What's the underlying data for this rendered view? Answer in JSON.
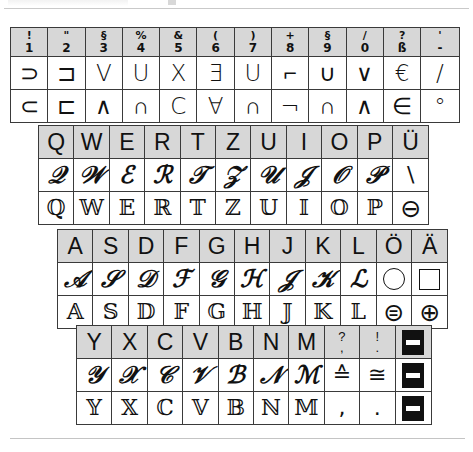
{
  "page": {
    "background_color": "#ffffff",
    "key_fill_color": "#d7d7d7",
    "border_color": "#3a3a3a",
    "rule_color": "#c4c4c4"
  },
  "numeric_block": {
    "name": "number-row",
    "keys": [
      {
        "shift": "!",
        "base": "1"
      },
      {
        "shift": "\"",
        "base": "2"
      },
      {
        "shift": "§",
        "base": "3"
      },
      {
        "shift": "%",
        "base": "4"
      },
      {
        "shift": "&",
        "base": "5"
      },
      {
        "shift": "(",
        "base": "6"
      },
      {
        "shift": ")",
        "base": "7"
      },
      {
        "shift": "+",
        "base": "8"
      },
      {
        "shift": "§",
        "base": "9"
      },
      {
        "shift": "/",
        "base": "0"
      },
      {
        "shift": "?",
        "base": "ß"
      },
      {
        "shift": "'",
        "base": "-"
      }
    ],
    "row_upper": [
      "⊃",
      "⊐",
      "V",
      "U",
      "X",
      "Ǝ",
      "U",
      "⌐",
      "∪",
      "∨",
      "€",
      "/"
    ],
    "row_lower": [
      "⊂",
      "⊏",
      "∧",
      "∩",
      "C",
      "∀",
      "∩",
      "¬",
      "∩",
      "∧",
      "∈",
      "°"
    ]
  },
  "q_block": {
    "name": "qwertz-row",
    "row_plain": [
      "Q",
      "W",
      "E",
      "R",
      "T",
      "Z",
      "U",
      "I",
      "O",
      "P",
      "Ü"
    ],
    "row_script": [
      "𝒬",
      "𝒲",
      "ℰ",
      "ℛ",
      "𝒯",
      "𝒵",
      "𝒰",
      "𝒥",
      "𝒪",
      "𝒫",
      "\\"
    ],
    "row_double": [
      "ℚ",
      "𝕎",
      "𝔼",
      "ℝ",
      "𝕋",
      "ℤ",
      "𝕌",
      "𝕀",
      "𝕆",
      "ℙ",
      "⊖"
    ]
  },
  "a_block": {
    "name": "asdf-row",
    "row_plain": [
      "A",
      "S",
      "D",
      "F",
      "G",
      "H",
      "J",
      "K",
      "L",
      "Ö",
      "Ä"
    ],
    "row_script": [
      "𝒜",
      "𝒮",
      "𝒟",
      "ℱ",
      "𝒢",
      "ℋ",
      "𝒥",
      "𝒦",
      "ℒ",
      "○",
      "□"
    ],
    "row_double": [
      "𝔸",
      "𝕊",
      "𝔻",
      "𝔽",
      "𝔾",
      "ℍ",
      "𝕁",
      "𝕂",
      "𝕃",
      "⊜",
      "⊕"
    ]
  },
  "y_block": {
    "name": "yxcv-row",
    "row_plain": [
      "Y",
      "X",
      "C",
      "V",
      "B",
      "N",
      "M"
    ],
    "row_plain_punct": [
      {
        "shift": "?",
        "base": ","
      },
      {
        "shift": "!",
        "base": "."
      }
    ],
    "row_plain_last_icon": "box-dash-icon",
    "row_script": [
      "𝒴",
      "𝒳",
      "𝒞",
      "𝒱",
      "ℬ",
      "𝒩",
      "ℳ"
    ],
    "row_script_punct": [
      "≙",
      "≅"
    ],
    "row_script_last_icon": "box-dash-icon",
    "row_double": [
      "𝕐",
      "𝕏",
      "ℂ",
      "𝕍",
      "𝔹",
      "ℕ",
      "𝕄"
    ],
    "row_double_punct": [
      ",",
      "."
    ],
    "row_double_last_icon": "box-dash-icon"
  }
}
